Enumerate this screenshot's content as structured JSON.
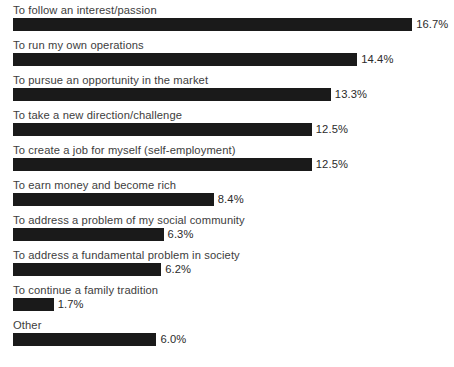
{
  "chart_data": {
    "type": "bar",
    "orientation": "horizontal",
    "title": "",
    "subtitle": "",
    "xlabel": "",
    "ylabel": "",
    "grid": false,
    "legend": false,
    "axis_visible": false,
    "value_suffix": "%",
    "xlim": [
      0,
      17.9
    ],
    "categories": [
      "To follow an interest/passion",
      "To run my own operations",
      "To pursue an opportunity in the market",
      "To take a new direction/challenge",
      "To create a job for myself (self-employment)",
      "To earn money and become rich",
      "To address a problem of my social community",
      "To address a fundamental problem in society",
      "To continue a family tradition",
      "Other"
    ],
    "values": [
      16.7,
      14.4,
      13.3,
      12.5,
      12.5,
      8.4,
      6.3,
      6.2,
      1.7,
      6.0
    ],
    "value_labels": [
      "16.7%",
      "14.4%",
      "13.3%",
      "12.5%",
      "12.5%",
      "8.4%",
      "6.3%",
      "6.2%",
      "1.7%",
      "6.0%"
    ],
    "bar_color": "#1a1a1a",
    "background_color": "#ffffff",
    "label_color": "#3d3d3d",
    "value_color": "#2b2b2b"
  }
}
